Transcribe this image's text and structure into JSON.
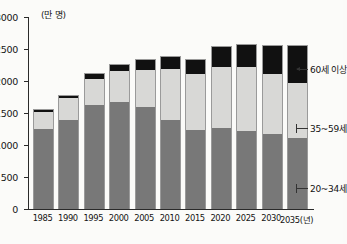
{
  "chart_data": {
    "type": "bar",
    "stacked": true,
    "title": "",
    "subtitle": "",
    "unit_label": "(만 명)",
    "xlabel": "(년)",
    "ylabel": "",
    "ylim": [
      0,
      3000
    ],
    "ytick_step": 500,
    "yticks": [
      "0",
      "500",
      "1000",
      "1500",
      "2000",
      "2500",
      "3000"
    ],
    "grid": false,
    "legend_position": "right-inline",
    "categories": [
      "1985",
      "1990",
      "1995",
      "2000",
      "2005",
      "2010",
      "2015",
      "2020",
      "2025",
      "2030",
      "2035"
    ],
    "xtick_labels": [
      "1985",
      "1990",
      "1995",
      "2000",
      "2005",
      "2010",
      "2015",
      "2020",
      "2025",
      "2030",
      "2035(년)"
    ],
    "series": [
      {
        "name": "20~34세",
        "color": "#787878",
        "values": [
          1250,
          1390,
          1620,
          1675,
          1600,
          1385,
          1240,
          1265,
          1220,
          1170,
          1105
        ]
      },
      {
        "name": "35~59세",
        "color": "#d8d8d6",
        "values": [
          270,
          345,
          415,
          480,
          580,
          805,
          865,
          955,
          1000,
          935,
          870
        ]
      },
      {
        "name": "60세 이상",
        "color": "#111111",
        "values": [
          25,
          35,
          70,
          90,
          150,
          185,
          230,
          315,
          345,
          445,
          580
        ]
      }
    ],
    "totals": [
      1545,
      1770,
      2105,
      2245,
      2330,
      2375,
      2335,
      2535,
      2565,
      2550,
      2555
    ]
  },
  "legend": {
    "items": [
      {
        "label": "60세 이상",
        "marker": "arrow"
      },
      {
        "label": "35~59세",
        "marker": "tickmark"
      },
      {
        "label": "20~34세",
        "marker": "tickmark"
      }
    ]
  }
}
